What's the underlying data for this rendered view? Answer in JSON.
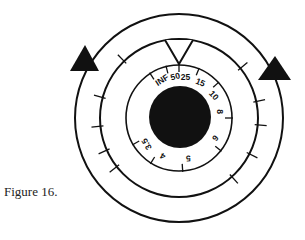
{
  "caption": "Figure 16.",
  "dial": {
    "center": [
      179,
      118
    ],
    "outer_radius": 104,
    "middle_radius": 79,
    "inner_radius": 53,
    "hub_radius": 31,
    "color": "#111111",
    "distance_scale": [
      {
        "label": "INF",
        "angle": -33
      },
      {
        "label": "50",
        "angle": -14
      },
      {
        "label": "25",
        "angle": 0
      },
      {
        "label": "15",
        "angle": 22
      },
      {
        "label": "10",
        "angle": 48
      },
      {
        "label": "8",
        "angle": 90
      },
      {
        "label": "6",
        "angle": 128
      },
      {
        "label": "5",
        "angle": 176
      },
      {
        "label": "4",
        "angle": 212
      },
      {
        "label": "3.5",
        "angle": 240
      }
    ],
    "ring_ticks": [
      -134,
      -165,
      174,
      156,
      142,
      -39,
      -12,
      5,
      27,
      48
    ],
    "index_mark": "V notch at top",
    "arrows": [
      "left-triangle",
      "right-triangle"
    ]
  }
}
